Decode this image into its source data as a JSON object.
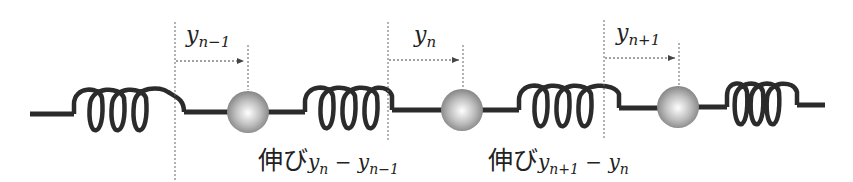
{
  "diagram": {
    "colors": {
      "line": "#2b2b2b",
      "mass": "#a8a8a8",
      "guide": "#666666"
    },
    "displacements": [
      {
        "var": "y",
        "sub": "n−1"
      },
      {
        "var": "y",
        "sub": "n"
      },
      {
        "var": "y",
        "sub": "n+1"
      }
    ],
    "extensions": [
      {
        "prefix": "伸び",
        "a_var": "y",
        "a_sub": "n",
        "op": " − ",
        "b_var": "y",
        "b_sub": "n−1"
      },
      {
        "prefix": "伸び",
        "a_var": "y",
        "a_sub": "n+1",
        "op": " − ",
        "b_var": "y",
        "b_sub": "n"
      }
    ]
  }
}
